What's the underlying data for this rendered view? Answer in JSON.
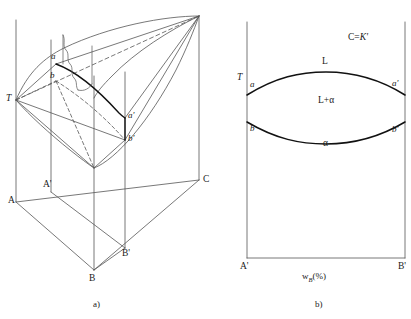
{
  "figure": {
    "title_caption_a": "a)",
    "title_caption_b": "b)",
    "panel_a": {
      "name": "three-dimensional-phase-prism",
      "vertices": {
        "A": "A",
        "A_prime": "A'",
        "B": "B",
        "B_prime": "B'",
        "C": "C",
        "T": "T",
        "a": "a",
        "a_prime": "a'",
        "b": "b",
        "b_prime": "b'"
      }
    },
    "panel_b": {
      "name": "pseudo-binary-section",
      "axis_y_label": "T",
      "axis_x_label_main": "w",
      "axis_x_label_sub": "B",
      "axis_x_label_tail": "(%)",
      "section_label_prefix": "C=",
      "section_label_value": "K'",
      "corner_left": "A'",
      "corner_right": "B'",
      "points": {
        "a": "a",
        "a_prime": "a'",
        "b": "b",
        "b_prime": "b'"
      },
      "regions": {
        "liquid": "L",
        "two_phase": "L+α",
        "solid": "α"
      }
    },
    "colors": {
      "line": "#555555",
      "bold_line": "#111111",
      "text": "#1a1a1a",
      "background": "#ffffff"
    }
  }
}
